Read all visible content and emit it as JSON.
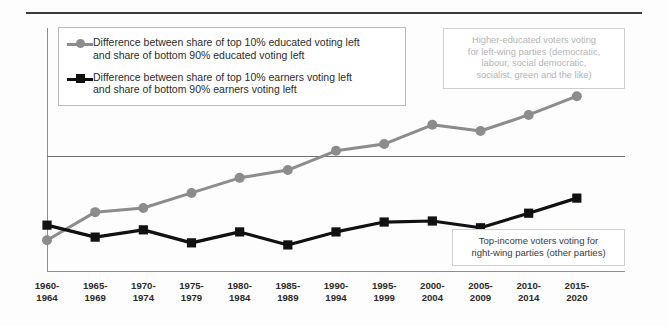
{
  "legend": {
    "items": [
      {
        "marker": "gray-circle-marker",
        "color": "#8c8c8c",
        "line1": "Difference between share of top 10% educated voting left",
        "line2": "and share of bottom 90% educated voting left"
      },
      {
        "marker": "black-square-marker",
        "color": "#111111",
        "line1": "Difference between share of top 10% earners voting left",
        "line2": "and share of bottom 90% earners voting left"
      }
    ]
  },
  "annotations": {
    "top": {
      "lines": [
        "Higher-educated voters voting",
        "for left-wing parties (democratic,",
        "labour, social democratic,",
        "socialist, green and the like)"
      ],
      "color": "#b3b3b3"
    },
    "bottom": {
      "lines": [
        "Top-income voters voting for",
        "right-wing parties (other parties)"
      ],
      "color": "#3a3a3a"
    }
  },
  "chart_data": {
    "type": "line",
    "title": "",
    "xlabel": "",
    "ylabel": "",
    "grid": false,
    "legend_position": "top-left",
    "zero_line": 0,
    "categories": [
      "1960-\n1964",
      "1965-\n1969",
      "1970-\n1974",
      "1975-\n1979",
      "1980-\n1984",
      "1985-\n1989",
      "1990-\n1994",
      "1995-\n1999",
      "2000-\n2004",
      "2005-\n2009",
      "2010-\n2014",
      "2015-\n2020"
    ],
    "categories_line1": [
      "1960-",
      "1965-",
      "1970-",
      "1975-",
      "1980-",
      "1985-",
      "1990-",
      "1995-",
      "2000-",
      "2005-",
      "2010-",
      "2015-"
    ],
    "categories_line2": [
      "1964",
      "1969",
      "1974",
      "1979",
      "1984",
      "1989",
      "1994",
      "1999",
      "2004",
      "2009",
      "2014",
      "2020"
    ],
    "ylim": [
      -2.6,
      1.4
    ],
    "series": [
      {
        "name": "Difference between share of top 10% educated voting left and share of bottom 90% educated voting left",
        "color": "#8c8c8c",
        "marker": "circle",
        "values": [
          -1.62,
          -1.08,
          -1.0,
          -0.71,
          -0.42,
          -0.27,
          0.1,
          0.23,
          0.6,
          0.48,
          0.79,
          1.15
        ]
      },
      {
        "name": "Difference between share of top 10% earners voting left and share of bottom 90% earners voting left",
        "color": "#111111",
        "marker": "square",
        "values": [
          -1.33,
          -1.56,
          -1.42,
          -1.67,
          -1.46,
          -1.71,
          -1.46,
          -1.27,
          -1.25,
          -1.38,
          -1.1,
          -0.81
        ]
      }
    ]
  }
}
